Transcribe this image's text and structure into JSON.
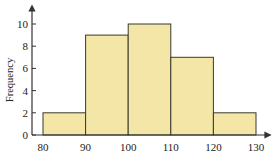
{
  "chart_data": {
    "type": "bar",
    "subtype": "histogram",
    "title": "",
    "xlabel": "",
    "ylabel": "Frequency",
    "bins": [
      {
        "start": 80,
        "end": 90,
        "value": 2
      },
      {
        "start": 90,
        "end": 100,
        "value": 9
      },
      {
        "start": 100,
        "end": 110,
        "value": 10
      },
      {
        "start": 110,
        "end": 120,
        "value": 7
      },
      {
        "start": 120,
        "end": 130,
        "value": 2
      }
    ],
    "categories": [
      "80-90",
      "90-100",
      "100-110",
      "110-120",
      "120-130"
    ],
    "values": [
      2,
      9,
      10,
      7,
      2
    ],
    "x_ticks": [
      80,
      90,
      100,
      110,
      120,
      130
    ],
    "y_ticks": [
      0,
      2,
      4,
      6,
      8,
      10
    ],
    "xlim": [
      80,
      130
    ],
    "ylim": [
      0,
      10
    ],
    "grid": false,
    "legend": null,
    "colors": {
      "bar_fill": "#f3e6a6",
      "bar_edge": "#3a3a2e",
      "axis": "#333333"
    }
  }
}
